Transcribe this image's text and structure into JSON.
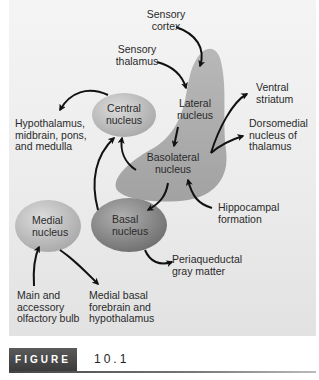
{
  "figure": {
    "tag": "FIGURE",
    "number": "10.1"
  },
  "colors": {
    "panel_bg": "#ececec",
    "amygdala_region": "#a9a9a9",
    "nucleus_light": "#c4c4c4",
    "nucleus_dark": "#8e8e8e",
    "arrow": "#111111"
  },
  "nodes": {
    "central": "Central\nnucleus",
    "central_l1": "Central",
    "central_l2": "nucleus",
    "lateral_l1": "Lateral",
    "lateral_l2": "nucleus",
    "basolateral_l1": "Basolateral",
    "basolateral_l2": "nucleus",
    "basal_l1": "Basal",
    "basal_l2": "nucleus",
    "medial_l1": "Medial",
    "medial_l2": "nucleus"
  },
  "labels": {
    "sensory_cortex_l1": "Sensory",
    "sensory_cortex_l2": "cortex",
    "sensory_thalamus_l1": "Sensory",
    "sensory_thalamus_l2": "thalamus",
    "hypothalamus_l1": "Hypothalamus,",
    "hypothalamus_l2": "midbrain, pons,",
    "hypothalamus_l3": "and medulla",
    "ventral_striatum_l1": "Ventral",
    "ventral_striatum_l2": "striatum",
    "dorsomedial_l1": "Dorsomedial",
    "dorsomedial_l2": "nucleus of",
    "dorsomedial_l3": "thalamus",
    "hippocampal_l1": "Hippocampal",
    "hippocampal_l2": "formation",
    "periaqueductal_l1": "Periaqueductal",
    "periaqueductal_l2": "gray matter",
    "olfactory_l1": "Main and",
    "olfactory_l2": "accessory",
    "olfactory_l3": "olfactory bulb",
    "medial_basal_l1": "Medial basal",
    "medial_basal_l2": "forebrain and",
    "medial_basal_l3": "hypothalamus"
  },
  "connections": [
    {
      "from": "Sensory cortex",
      "to": "Lateral nucleus"
    },
    {
      "from": "Sensory thalamus",
      "to": "Lateral nucleus"
    },
    {
      "from": "Lateral nucleus",
      "to": "Basolateral nucleus"
    },
    {
      "from": "Basolateral nucleus",
      "to": "Central nucleus"
    },
    {
      "from": "Basolateral nucleus",
      "to": "Basal nucleus"
    },
    {
      "from": "Basolateral nucleus",
      "to": "Ventral striatum"
    },
    {
      "from": "Basolateral nucleus",
      "to": "Dorsomedial nucleus of thalamus"
    },
    {
      "from": "Hippocampal formation",
      "to": "Basolateral nucleus"
    },
    {
      "from": "Basal nucleus",
      "to": "Central nucleus"
    },
    {
      "from": "Basal nucleus",
      "to": "Periaqueductal gray matter"
    },
    {
      "from": "Central nucleus",
      "to": "Hypothalamus, midbrain, pons, and medulla"
    },
    {
      "from": "Main and accessory olfactory bulb",
      "to": "Medial nucleus"
    },
    {
      "from": "Medial nucleus",
      "to": "Medial basal forebrain and hypothalamus"
    }
  ]
}
